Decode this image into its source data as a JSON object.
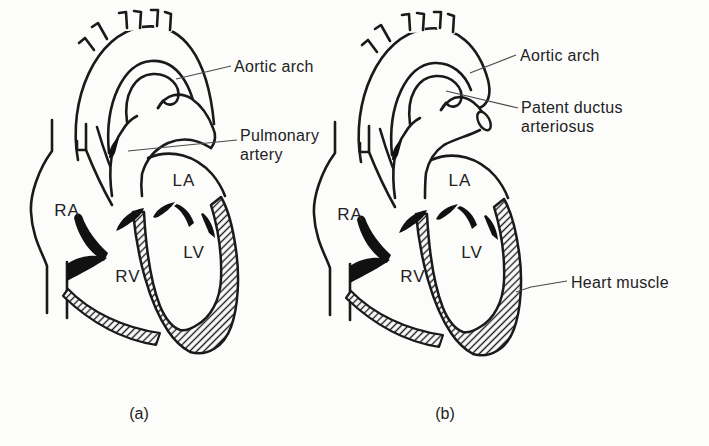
{
  "figure": {
    "type": "anatomical-diagram",
    "colors": {
      "ink": "#1a1a1a",
      "background": "#fcfcfb",
      "leader": "#4a4a4a"
    },
    "panels": [
      {
        "caption": "(a)",
        "chambers": {
          "ra": "RA",
          "la": "LA",
          "lv": "LV",
          "rv": "RV"
        },
        "labels": {
          "aortic_arch": "Aortic arch",
          "pulmonary_artery": "Pulmonary artery"
        }
      },
      {
        "caption": "(b)",
        "chambers": {
          "ra": "RA",
          "la": "LA",
          "lv": "LV",
          "rv": "RV"
        },
        "labels": {
          "aortic_arch": "Aortic arch",
          "patent_ductus": "Patent ductus arteriosus",
          "heart_muscle": "Heart muscle"
        }
      }
    ]
  }
}
